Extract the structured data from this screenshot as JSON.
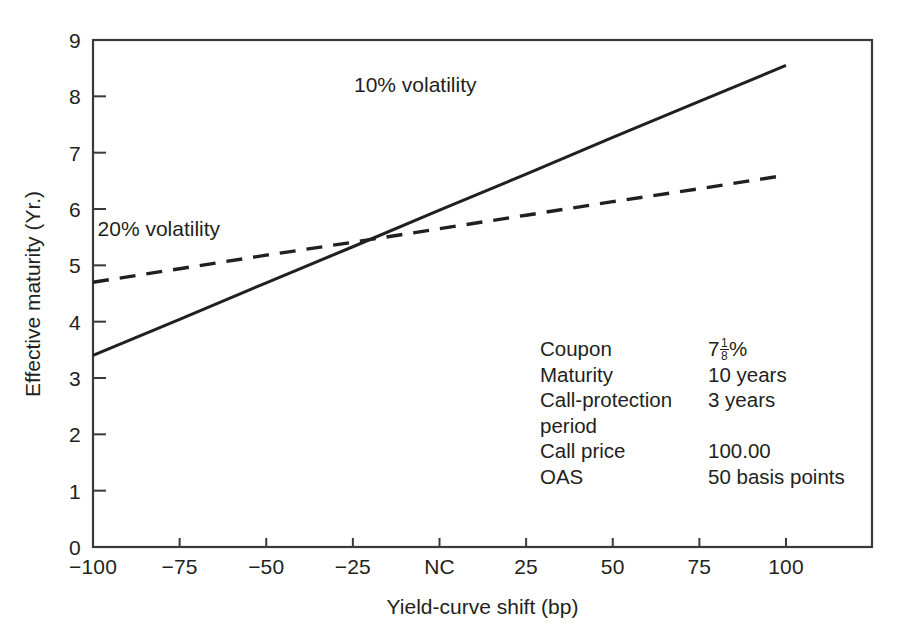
{
  "chart_data": {
    "type": "line",
    "title": "",
    "xlabel": "Yield-curve shift (bp)",
    "ylabel": "Effective maturity (Yr.)",
    "x": [
      -100,
      -75,
      -50,
      -25,
      0,
      25,
      50,
      75,
      100
    ],
    "xtick_labels": [
      "−100",
      "−75",
      "−50",
      "−25",
      "NC",
      "25",
      "50",
      "75",
      "100"
    ],
    "ytick_labels": [
      "0",
      "1",
      "2",
      "3",
      "4",
      "5",
      "6",
      "7",
      "8",
      "9"
    ],
    "xlim": [
      -100,
      100
    ],
    "ylim": [
      0,
      9
    ],
    "grid": false,
    "legend": "inline-annotations",
    "series": [
      {
        "name": "10% volatility",
        "style": "solid",
        "color": "#231f20",
        "values": [
          3.4,
          4.04,
          4.69,
          5.33,
          5.98,
          6.62,
          7.27,
          7.91,
          8.55
        ],
        "label_x": -7,
        "label_y": 8.2
      },
      {
        "name": "20% volatility",
        "style": "dashed",
        "color": "#231f20",
        "values": [
          4.7,
          4.94,
          5.18,
          5.41,
          5.65,
          5.89,
          6.13,
          6.36,
          6.6
        ],
        "label_x": -81,
        "label_y": 5.64
      }
    ],
    "crossover": {
      "x": -20,
      "y": 5.45
    }
  },
  "axes": {
    "y_title": "Effective maturity (Yr.)",
    "x_title": "Yield-curve shift (bp)",
    "xticks": [
      {
        "label": "−100",
        "value": -100
      },
      {
        "label": "−75",
        "value": -75
      },
      {
        "label": "−50",
        "value": -50
      },
      {
        "label": "−25",
        "value": -25
      },
      {
        "label": "NC",
        "value": 0
      },
      {
        "label": "25",
        "value": 25
      },
      {
        "label": "50",
        "value": 50
      },
      {
        "label": "75",
        "value": 75
      },
      {
        "label": "100",
        "value": 100
      }
    ],
    "yticks": [
      {
        "label": "0",
        "value": 0
      },
      {
        "label": "1",
        "value": 1
      },
      {
        "label": "2",
        "value": 2
      },
      {
        "label": "3",
        "value": 3
      },
      {
        "label": "4",
        "value": 4
      },
      {
        "label": "5",
        "value": 5
      },
      {
        "label": "6",
        "value": 6
      },
      {
        "label": "7",
        "value": 7
      },
      {
        "label": "8",
        "value": 8
      },
      {
        "label": "9",
        "value": 9
      }
    ]
  },
  "series_labels": {
    "solid": "10% volatility",
    "dashed": "20% volatility"
  },
  "annotation": {
    "rows": [
      {
        "term": "Coupon",
        "value_prefix": "7",
        "value_fraction_num": "1",
        "value_fraction_den": "8",
        "value_suffix": "%",
        "value_text": "7 1/8 %"
      },
      {
        "term": "Maturity",
        "value_text": "10 years"
      },
      {
        "term": "Call-protection",
        "value_text": "3 years"
      },
      {
        "term": "period",
        "value_text": ""
      },
      {
        "term": "Call price",
        "value_text": "100.00"
      },
      {
        "term": "OAS",
        "value_text": "50 basis points"
      }
    ]
  },
  "colors": {
    "ink": "#231f20",
    "background": "#ffffff",
    "frame": "#3a3a3a"
  }
}
